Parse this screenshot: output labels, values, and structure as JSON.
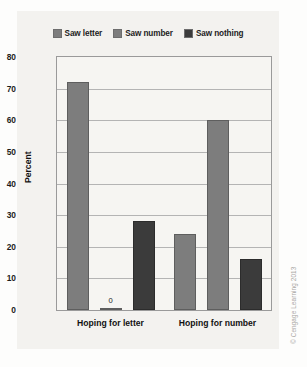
{
  "chart_data": {
    "type": "bar",
    "title": "",
    "xlabel": "",
    "ylabel": "Percent",
    "ylim": [
      0,
      80
    ],
    "ytick_step": 10,
    "yticks": [
      80,
      70,
      60,
      50,
      40,
      30,
      20,
      10,
      0
    ],
    "grid": "horizontal",
    "legend_position": "top-center",
    "categories": [
      "Hoping for letter",
      "Hoping for number"
    ],
    "series": [
      {
        "name": "Saw letter",
        "values": [
          72,
          24
        ],
        "color": "#7d7d7d"
      },
      {
        "name": "Saw number",
        "values": [
          0,
          60
        ],
        "color": "#7d7d7d"
      },
      {
        "name": "Saw nothing",
        "values": [
          28,
          16
        ],
        "color": "#3b3b3b"
      }
    ],
    "data_labels": [
      {
        "series": "Saw number",
        "category": "Hoping for letter",
        "text": "0"
      }
    ]
  },
  "legend": {
    "items": [
      {
        "label": "Saw letter"
      },
      {
        "label": "Saw number"
      },
      {
        "label": "Saw nothing"
      }
    ]
  },
  "axes": {
    "y_title": "Percent",
    "y_ticks": [
      "80",
      "70",
      "60",
      "50",
      "40",
      "30",
      "20",
      "10",
      "0"
    ],
    "x_ticks": [
      "Hoping for letter",
      "Hoping for number"
    ]
  },
  "credit": {
    "text": "© Cengage Learning 2013"
  }
}
